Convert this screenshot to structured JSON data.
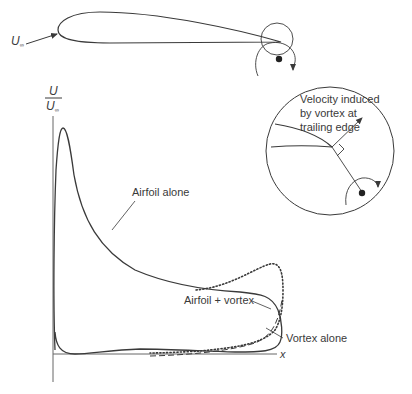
{
  "diagram": {
    "freestream_label": "U",
    "freestream_subscript": "∞",
    "y_axis_label_numerator": "U",
    "y_axis_label_denominator": "U",
    "y_axis_label_denominator_subscript": "∞",
    "x_axis_label": "x",
    "annotations": {
      "airfoil_alone": "Airfoil alone",
      "airfoil_plus_vortex": "Airfoil + vortex",
      "vortex_alone": "Vortex alone"
    },
    "inset": {
      "line1": "Velocity induced",
      "line2": "by vortex at",
      "line3": "trailing edge"
    },
    "colors": {
      "stroke": "#3a3a3a",
      "background": "#ffffff"
    }
  }
}
